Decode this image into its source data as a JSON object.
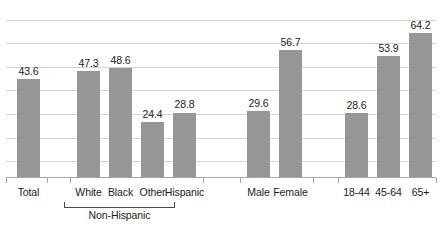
{
  "chart_data": {
    "type": "bar",
    "title": "",
    "subtitle": "",
    "xlabel": "",
    "ylabel": "",
    "ylim": [
      0,
      75
    ],
    "grid": true,
    "gridline_step": 10,
    "legend": "none",
    "bar_color": "#969696",
    "gridline_color": "#d4d4d4",
    "axis_color": "#a6a6a6",
    "categories": [
      "Total",
      "White",
      "Black",
      "Other",
      "Hispanic",
      "Male",
      "Female",
      "18-44",
      "45-64",
      "65+"
    ],
    "values": [
      43.6,
      47.3,
      48.6,
      24.4,
      28.8,
      29.6,
      56.7,
      28.6,
      53.9,
      64.2
    ],
    "value_labels": [
      "43.6",
      "47.3",
      "48.6",
      "24.4",
      "28.8",
      "29.6",
      "56.7",
      "28.6",
      "53.9",
      "64.2"
    ],
    "group_bracket": {
      "label": "Non-Hispanic",
      "covers": [
        "White",
        "Black",
        "Other"
      ]
    }
  },
  "bars": [
    {
      "label": "Total",
      "value_label": "43.6",
      "value": 43.6,
      "x": 17,
      "width": 23
    },
    {
      "label": "White",
      "value_label": "47.3",
      "value": 47.3,
      "x": 77,
      "width": 23
    },
    {
      "label": "Black",
      "value_label": "48.6",
      "value": 48.6,
      "x": 109,
      "width": 23
    },
    {
      "label": "Other",
      "value_label": "24.4",
      "value": 24.4,
      "x": 141,
      "width": 23
    },
    {
      "label": "Hispanic",
      "value_label": "28.8",
      "value": 28.8,
      "x": 173,
      "width": 23
    },
    {
      "label": "Male",
      "value_label": "29.6",
      "value": 29.6,
      "x": 247,
      "width": 23
    },
    {
      "label": "Female",
      "value_label": "56.7",
      "value": 56.7,
      "x": 279,
      "width": 23
    },
    {
      "label": "18-44",
      "value_label": "28.6",
      "value": 28.6,
      "x": 345,
      "width": 23
    },
    {
      "label": "45-64",
      "value_label": "53.9",
      "value": 53.9,
      "x": 377,
      "width": 23
    },
    {
      "label": "65+",
      "value_label": "64.2",
      "value": 64.2,
      "x": 409,
      "width": 23
    }
  ],
  "ticks_x": [
    6,
    47,
    70,
    203,
    240,
    313,
    338,
    436
  ],
  "gridlines_y": [
    12,
    35,
    59,
    82,
    106,
    130,
    153
  ],
  "bracket": {
    "label": "Non-Hispanic"
  }
}
